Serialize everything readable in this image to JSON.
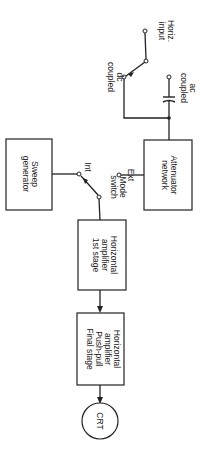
{
  "diagram": {
    "orientation": "rotated 90 degrees clockwise",
    "input": {
      "label_line1": "Horiz.",
      "label_line2": "input"
    },
    "coupling": {
      "ac_line1": "ac",
      "ac_line2": "coupled",
      "dc_line1": "dc",
      "dc_line2": "coupled"
    },
    "blocks": {
      "attenuator": {
        "line1": "Attenuator",
        "line2": "network"
      },
      "sweep": {
        "line1": "Sweep",
        "line2": "generator"
      },
      "amp1": {
        "line1": "Horizontal",
        "line2": "amplifier",
        "line3": "1st stage"
      },
      "amp2": {
        "line1": "Horizontal",
        "line2": "amplifier",
        "line3": "Push-pull",
        "line4": "Final stage"
      },
      "crt": {
        "label": "CRT"
      }
    },
    "mode_switch": {
      "ext": "Ext",
      "mode_line1": "Mode",
      "mode_line2": "switch",
      "int": "Int"
    }
  }
}
